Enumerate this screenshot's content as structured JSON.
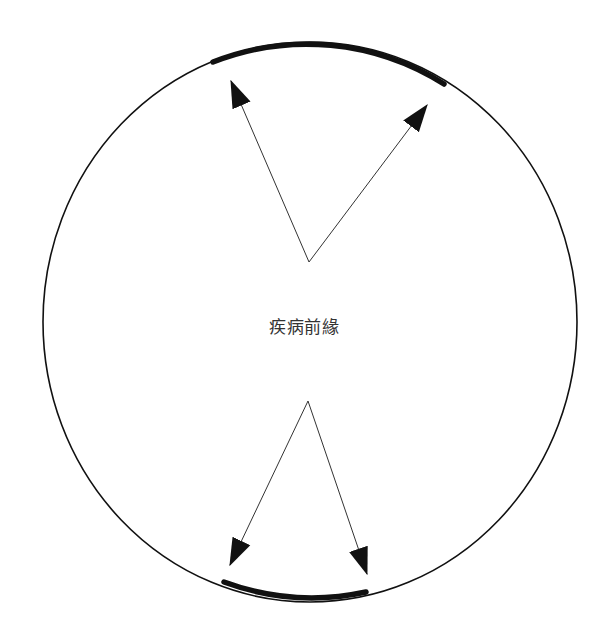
{
  "diagram": {
    "title": "",
    "center_label": "疾病前緣",
    "colors": {
      "background": "#ffffff",
      "stroke": "#111111",
      "text": "#333333"
    },
    "circle": {
      "cx": 310,
      "cy": 322,
      "rx": 267,
      "ry": 280
    },
    "boundary_segments": [
      {
        "name": "upper-advancing-margin",
        "from": [
          213,
          62
        ],
        "to": [
          444,
          84
        ]
      },
      {
        "name": "lower-advancing-margin",
        "from": [
          224,
          582
        ],
        "to": [
          366,
          592
        ]
      }
    ],
    "arrows": [
      {
        "name": "upper-left-arrow",
        "from": [
          309,
          262
        ],
        "to": [
          231,
          81
        ]
      },
      {
        "name": "upper-right-arrow",
        "from": [
          309,
          262
        ],
        "to": [
          427,
          105
        ]
      },
      {
        "name": "lower-left-arrow",
        "from": [
          308,
          401
        ],
        "to": [
          230,
          565
        ]
      },
      {
        "name": "lower-right-arrow",
        "from": [
          308,
          401
        ],
        "to": [
          367,
          574
        ]
      }
    ]
  }
}
